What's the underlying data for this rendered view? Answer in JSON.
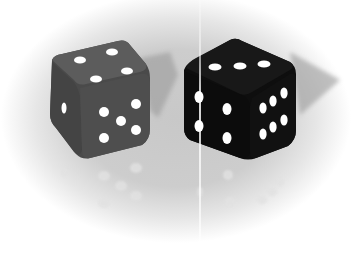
{
  "image": {
    "description": "Two six-sided dice on a light gray surface with faint reflections",
    "width": 352,
    "height": 255
  },
  "colors": {
    "background_center": "#c8c8c8",
    "background_edge": "#ffffff",
    "left_die_body": "#4a4a4a",
    "left_die_top": "#5a5a5a",
    "right_die_body": "#0e0e0e",
    "right_die_top": "#151515",
    "pip": "#ffffff",
    "shadow": "#9a9a9a",
    "divider_line": "#f4f4f4"
  },
  "dice": [
    {
      "name": "left-die",
      "color": "translucent dark gray",
      "faces": {
        "top": 4,
        "front": 1,
        "right": 5
      }
    },
    {
      "name": "right-die",
      "color": "black",
      "faces": {
        "top": 3,
        "front": 4,
        "right": 6
      }
    }
  ],
  "caption": "Two dice"
}
